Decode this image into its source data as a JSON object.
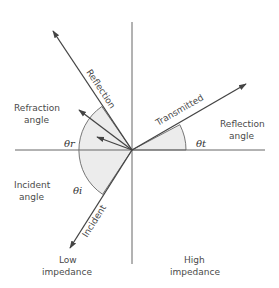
{
  "diagram": {
    "colors": {
      "line": "#555555",
      "shade": "#ececec",
      "text": "#4a4a4a"
    },
    "center": [
      132,
      150
    ],
    "rays": [
      {
        "name": "reflection",
        "label": "Reflection",
        "tip": [
          53,
          31
        ]
      },
      {
        "name": "refraction-outer",
        "label": "",
        "tip": [
          79,
          110
        ]
      },
      {
        "name": "refraction-inner",
        "label": "",
        "tip": [
          97,
          137
        ]
      },
      {
        "name": "transmitted",
        "label": "Transmitted",
        "tip": [
          246,
          84
        ]
      },
      {
        "name": "incident",
        "label": "Incident",
        "tip": [
          70,
          248
        ]
      }
    ],
    "angle_symbols": {
      "left_upper": "θr",
      "left_lower": "θi",
      "right": "θt"
    },
    "labels": {
      "refraction_angle_line1": "Refraction",
      "refraction_angle_line2": "angle",
      "reflection_angle_line1": "Reflection",
      "reflection_angle_line2": "angle",
      "incident_angle_line1": "Incident",
      "incident_angle_line2": "angle",
      "low_line1": "Low",
      "low_line2": "impedance",
      "high_line1": "High",
      "high_line2": "impedance"
    }
  }
}
